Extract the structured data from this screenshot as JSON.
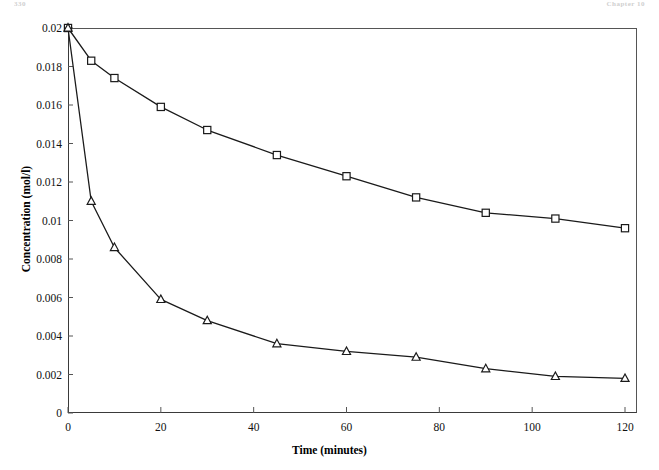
{
  "page_header": {
    "left_text": "330",
    "right_text": "Chapter 10"
  },
  "chart_data": {
    "type": "line",
    "title": "",
    "xlabel": "Time (minutes)",
    "ylabel": "Concentration (mol/l)",
    "x": [
      0,
      5,
      10,
      20,
      30,
      45,
      60,
      75,
      90,
      105,
      120
    ],
    "xlim": [
      0,
      124
    ],
    "ylim": [
      0,
      0.02
    ],
    "xticks": [
      0,
      20,
      40,
      60,
      80,
      100,
      120
    ],
    "xtick_labels": [
      "0",
      "20",
      "40",
      "60",
      "80",
      "100",
      "120"
    ],
    "yticks": [
      0,
      0.002,
      0.004,
      0.006,
      0.008,
      0.01,
      0.012,
      0.014,
      0.016,
      0.018,
      0.02
    ],
    "ytick_labels": [
      "0",
      "0.002",
      "0.004",
      "0.006",
      "0.008",
      "0.01",
      "0.012",
      "0.014",
      "0.016",
      "0.018",
      "0.02"
    ],
    "grid": false,
    "legend": null,
    "legend_position": "none",
    "series": [
      {
        "name": "upper-curve",
        "marker": "square",
        "marker_color": "#ffffff",
        "line_color": "#1a1a1a",
        "values": [
          0.02,
          0.0183,
          0.0174,
          0.0159,
          0.0147,
          0.0134,
          0.0123,
          0.0112,
          0.0104,
          0.0101,
          0.0096
        ]
      },
      {
        "name": "lower-curve",
        "marker": "triangle",
        "marker_color": "#ffffff",
        "line_color": "#1a1a1a",
        "values": [
          0.02,
          0.011,
          0.0086,
          0.0059,
          0.0048,
          0.0036,
          0.0032,
          0.0029,
          0.0023,
          0.0019,
          0.0018
        ]
      }
    ]
  }
}
